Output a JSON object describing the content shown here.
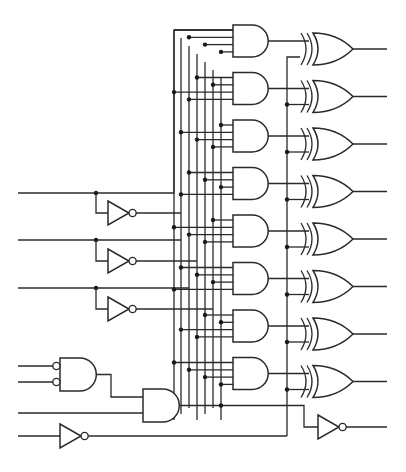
{
  "diagram": {
    "title": "Logic circuit: 3-to-8 decoder feeding XOR bank with enable logic",
    "colors": {
      "wire": "#2a2a2a",
      "background": "#ffffff",
      "junction": "#1a1a1a"
    },
    "inputs": {
      "select_lines_y": [
        193,
        240,
        288
      ],
      "enable_bubbled_inputs_y": [
        366,
        382
      ],
      "enable_direct_input_y": 413,
      "inverted_input_y": 436
    },
    "and_gates": {
      "count": 8,
      "x_left": 233,
      "width": 40,
      "height": 32,
      "top_start": 25,
      "pitch": 47.5,
      "inputs_per_gate": 4
    },
    "xor_gates": {
      "count": 8,
      "x_left": 307,
      "width": 46,
      "output_end_x": 387,
      "style": "double-arc input"
    },
    "inverters": [
      {
        "id": "inv-a",
        "x": 108,
        "y_center": 213
      },
      {
        "id": "inv-b",
        "x": 108,
        "y_center": 261
      },
      {
        "id": "inv-c",
        "x": 108,
        "y_center": 309
      },
      {
        "id": "inv-enable",
        "x": 60,
        "y_center": 436
      },
      {
        "id": "inv-out",
        "x": 318,
        "y_center": 427
      }
    ],
    "enable_gates": [
      {
        "id": "and-bubbled",
        "type": "AND with inverted inputs",
        "x": 60,
        "y_top": 358,
        "height": 33
      },
      {
        "id": "and-enable",
        "type": "AND",
        "x": 143,
        "y_top": 389,
        "height": 33
      }
    ],
    "control_bus_x": 287
  }
}
